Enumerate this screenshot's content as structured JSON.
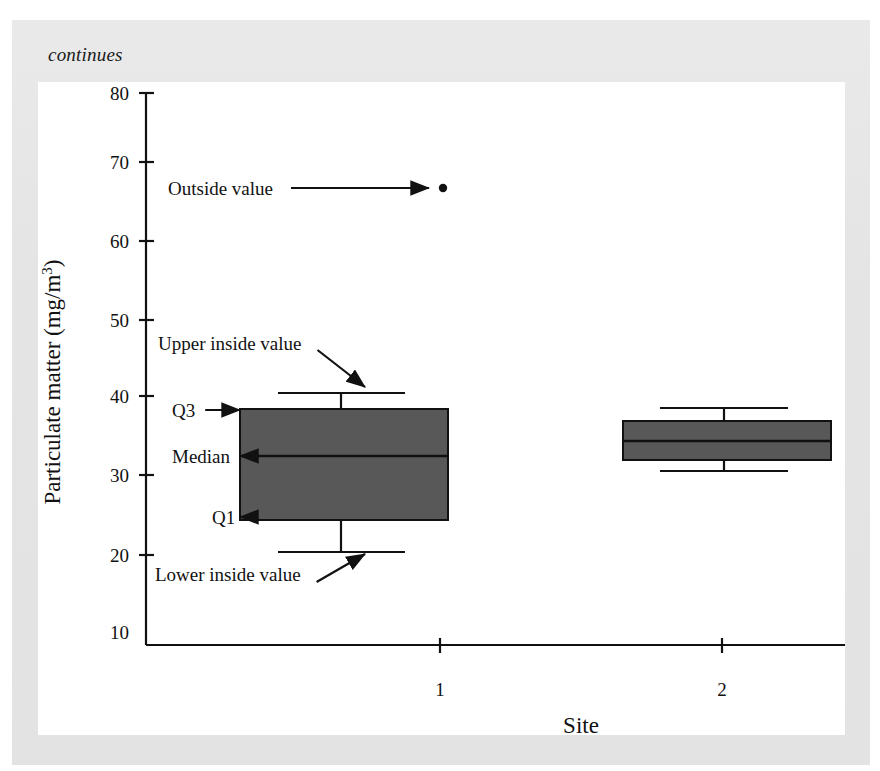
{
  "page": {
    "continues_note": "continues",
    "background_color": "#e7e7e7",
    "panel_color": "#ffffff"
  },
  "chart_data": {
    "type": "box",
    "title": "",
    "subtitle": "",
    "xlabel": "Site",
    "ylabel": "Particulate matter (mg/m3)",
    "ylabel_display": "Particulate matter (mg/m",
    "ylabel_superscript": "3",
    "ylabel_suffix": ")",
    "categories": [
      "1",
      "2"
    ],
    "xtick_labels": [
      "1",
      "2"
    ],
    "ytick_labels": [
      "80",
      "70",
      "60",
      "50",
      "40",
      "30",
      "20",
      "10"
    ],
    "yticks": [
      80,
      70,
      60,
      50,
      40,
      30,
      20,
      10
    ],
    "ylim": [
      9,
      80
    ],
    "grid": false,
    "legend": "none",
    "box_fill_color": "#585858",
    "line_color": "#111111",
    "boxes": [
      {
        "category": "1",
        "lower_inside_value": 22,
        "q1": 26,
        "median": 34,
        "q3": 40,
        "upper_inside_value": 42,
        "outside_values": [
          67.5
        ]
      },
      {
        "category": "2",
        "lower_inside_value": 32,
        "q1": 33.5,
        "median": 36,
        "q3": 38,
        "upper_inside_value": 40,
        "outside_values": []
      }
    ],
    "annotations": [
      {
        "id": "outside-value",
        "label": "Outside value",
        "target_value": 67.5,
        "target_category": "1"
      },
      {
        "id": "upper-inside-value",
        "label": "Upper inside value",
        "target_value": 42,
        "target_category": "1"
      },
      {
        "id": "q3",
        "label": "Q3",
        "target_value": 40,
        "target_category": "1"
      },
      {
        "id": "median",
        "label": "Median",
        "target_value": 34,
        "target_category": "1"
      },
      {
        "id": "q1",
        "label": "Q1",
        "target_value": 26,
        "target_category": "1"
      },
      {
        "id": "lower-inside-value",
        "label": "Lower inside value",
        "target_value": 22,
        "target_category": "1"
      }
    ]
  }
}
